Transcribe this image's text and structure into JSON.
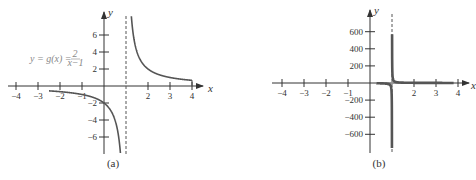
{
  "chart_data": [
    {
      "type": "line",
      "panel": "a",
      "caption": "(a)",
      "title": "",
      "annotation": "y = g(x) = 2/(x−1)",
      "annotation_parts": {
        "lhs": "y = g(x) =",
        "num": "2",
        "den": "x−1"
      },
      "xlabel": "x",
      "ylabel": "y",
      "xlim": [
        -4,
        4
      ],
      "ylim": [
        -8,
        8
      ],
      "x_ticks": [
        -4,
        -3,
        -2,
        -1,
        2,
        3,
        4
      ],
      "x_tick_labels": [
        "−4",
        "−3",
        "−2",
        "−1",
        "2",
        "3",
        "4"
      ],
      "y_ticks": [
        -6,
        -4,
        -2,
        2,
        4,
        6
      ],
      "y_tick_labels": [
        "−6",
        "−4",
        "−2",
        "2",
        "4",
        "6"
      ],
      "asymptote_x": 1,
      "function": "2/(x-1)",
      "domain_plotted": [
        -2.5,
        4
      ],
      "series": [
        {
          "name": "left branch",
          "x": [
            -2.5,
            -2,
            -1,
            0,
            0.5,
            0.7
          ],
          "y": [
            -0.57,
            -0.67,
            -1,
            -2,
            -4,
            -6.67
          ]
        },
        {
          "name": "right branch",
          "x": [
            1.25,
            1.5,
            2,
            3,
            4
          ],
          "y": [
            8,
            4,
            2,
            1,
            0.67
          ]
        }
      ],
      "grid": false
    },
    {
      "type": "line",
      "panel": "b",
      "caption": "(b)",
      "title": "",
      "xlabel": "x",
      "ylabel": "y",
      "xlim": [
        -4,
        4
      ],
      "ylim": [
        -800,
        800
      ],
      "x_ticks": [
        -4,
        -3,
        -2,
        -1,
        2,
        3,
        4
      ],
      "x_tick_labels": [
        "−4",
        "−3",
        "−2",
        "−1",
        "2",
        "3",
        "4"
      ],
      "y_ticks": [
        -600,
        -400,
        -200,
        200,
        400,
        600
      ],
      "y_tick_labels": [
        "−600",
        "−400",
        "−200",
        "200",
        "400",
        "600"
      ],
      "asymptote_x": 1,
      "function": "2/(x-1)",
      "domain_plotted": [
        0.3,
        3.8
      ],
      "series": [
        {
          "name": "left branch",
          "x": [
            0.3,
            0.9,
            0.99,
            0.996
          ],
          "y": [
            -2.9,
            -20,
            -200,
            -500
          ]
        },
        {
          "name": "right branch",
          "x": [
            1.006,
            1.01,
            1.1,
            2,
            3.8
          ],
          "y": [
            333,
            200,
            20,
            2,
            0.7
          ]
        }
      ],
      "grid": false
    }
  ]
}
